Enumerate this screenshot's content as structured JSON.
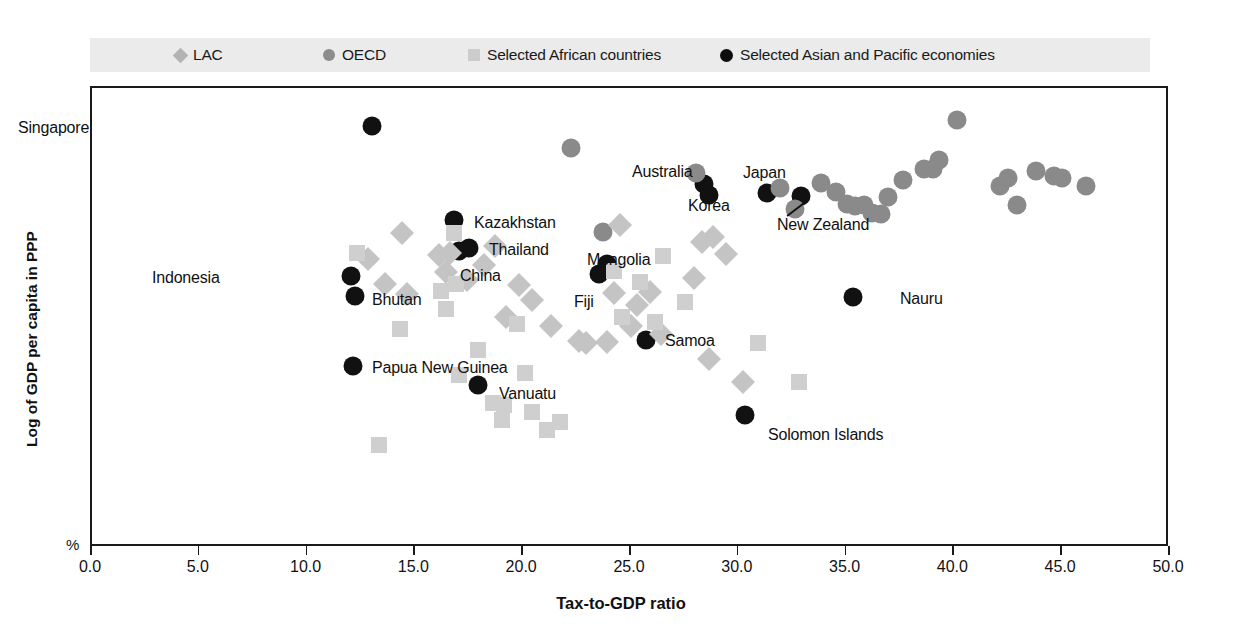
{
  "legend": {
    "items": [
      {
        "label": "LAC",
        "marker": "diamond",
        "color": "#b3b3b3",
        "x": 175
      },
      {
        "label": "OECD",
        "marker": "circle",
        "color": "#8c8c8c",
        "x": 323
      },
      {
        "label": "Selected African countries",
        "marker": "square",
        "color": "#cccccc",
        "x": 468
      },
      {
        "label": "Selected Asian and Pacific economies",
        "marker": "circle",
        "color": "#0d0d0d",
        "x": 720
      }
    ]
  },
  "axes": {
    "x_title": "Tax-to-GDP ratio",
    "y_title": "Log of GDP per capita in PPP",
    "y_unit": "%",
    "x_ticks": [
      "0.0",
      "5.0",
      "10.0",
      "15.0",
      "20.0",
      "25.0",
      "30.0",
      "35.0",
      "40.0",
      "45.0",
      "50.0"
    ]
  },
  "chart_data": {
    "type": "scatter",
    "title": "",
    "xlabel": "Tax-to-GDP ratio",
    "ylabel": "Log of GDP per capita in PPP",
    "xlim": [
      0.0,
      50.0
    ],
    "ylim": [
      0,
      100
    ],
    "grid": false,
    "legend_position": "top",
    "series": [
      {
        "name": "Selected Asian and Pacific economies",
        "marker": "circle",
        "color": "#111111",
        "points": [
          {
            "label": "Singapore",
            "x": 13.0,
            "y": 91.7,
            "lx": 16,
            "ly": 118
          },
          {
            "label": "Kazakhstan",
            "x": 16.8,
            "y": 71.3,
            "lx": 472,
            "ly": 213
          },
          {
            "label": "Thailand",
            "x": 17.5,
            "y": 65.2,
            "lx": 487,
            "ly": 240
          },
          {
            "label": "China",
            "x": 17.0,
            "y": 64.6,
            "lx": 458,
            "ly": 266
          },
          {
            "label": "Indonesia",
            "x": 12.0,
            "y": 59.1,
            "lx": 150,
            "ly": 268
          },
          {
            "label": "Bhutan",
            "x": 12.2,
            "y": 54.8,
            "lx": 370,
            "ly": 290
          },
          {
            "label": "Papua New Guinea",
            "x": 12.1,
            "y": 39.6,
            "lx": 370,
            "ly": 358
          },
          {
            "label": "Vanuatu",
            "x": 17.9,
            "y": 35.4,
            "lx": 497,
            "ly": 384
          },
          {
            "label": "Mongolia",
            "x": 23.9,
            "y": 61.7,
            "lx": 585,
            "ly": 250
          },
          {
            "label": "Fiji",
            "x": 23.5,
            "y": 59.6,
            "lx": 572,
            "ly": 292
          },
          {
            "label": "Samoa",
            "x": 25.7,
            "y": 45.2,
            "lx": 663,
            "ly": 331
          },
          {
            "label": "Solomon Islands",
            "x": 30.3,
            "y": 28.9,
            "lx": 766,
            "ly": 425
          },
          {
            "label": "Nauru",
            "x": 35.3,
            "y": 54.6,
            "lx": 898,
            "ly": 289
          },
          {
            "label": "Australia",
            "x": 28.4,
            "y": 79.1,
            "lx": 630,
            "ly": 162
          },
          {
            "label": "Korea",
            "x": 28.6,
            "y": 76.7,
            "lx": 686,
            "ly": 196
          },
          {
            "label": "Japan",
            "x": 31.3,
            "y": 77.1,
            "lx": 741,
            "ly": 163
          },
          {
            "label": "New Zealand",
            "x": 32.9,
            "y": 76.5,
            "lx": 775,
            "ly": 215
          }
        ]
      },
      {
        "name": "OECD",
        "marker": "circle",
        "color": "#8a8a8a",
        "points": [
          {
            "x": 22.2,
            "y": 87.0
          },
          {
            "x": 23.7,
            "y": 68.7
          },
          {
            "x": 28.0,
            "y": 81.6
          },
          {
            "x": 31.9,
            "y": 78.3
          },
          {
            "x": 32.6,
            "y": 73.7
          },
          {
            "x": 33.8,
            "y": 79.3
          },
          {
            "x": 34.5,
            "y": 77.4
          },
          {
            "x": 35.0,
            "y": 74.7
          },
          {
            "x": 35.4,
            "y": 74.3
          },
          {
            "x": 35.8,
            "y": 74.5
          },
          {
            "x": 36.2,
            "y": 72.9
          },
          {
            "x": 36.6,
            "y": 72.6
          },
          {
            "x": 36.9,
            "y": 76.4
          },
          {
            "x": 37.6,
            "y": 80.0
          },
          {
            "x": 38.6,
            "y": 82.3
          },
          {
            "x": 39.0,
            "y": 82.5
          },
          {
            "x": 39.3,
            "y": 84.3
          },
          {
            "x": 40.1,
            "y": 93.0
          },
          {
            "x": 42.1,
            "y": 78.8
          },
          {
            "x": 42.5,
            "y": 80.4
          },
          {
            "x": 42.9,
            "y": 74.5
          },
          {
            "x": 43.8,
            "y": 81.9
          },
          {
            "x": 44.6,
            "y": 80.9
          },
          {
            "x": 45.0,
            "y": 80.4
          },
          {
            "x": 46.1,
            "y": 78.6
          }
        ]
      },
      {
        "name": "LAC",
        "marker": "diamond",
        "color": "#c4c4c4",
        "points": [
          {
            "x": 12.8,
            "y": 62.9
          },
          {
            "x": 13.6,
            "y": 57.5
          },
          {
            "x": 14.4,
            "y": 68.5
          },
          {
            "x": 14.6,
            "y": 55.2
          },
          {
            "x": 16.1,
            "y": 63.8
          },
          {
            "x": 16.6,
            "y": 64.2
          },
          {
            "x": 16.4,
            "y": 60.0
          },
          {
            "x": 18.2,
            "y": 61.5
          },
          {
            "x": 17.4,
            "y": 58.3
          },
          {
            "x": 18.7,
            "y": 65.6
          },
          {
            "x": 19.8,
            "y": 57.2
          },
          {
            "x": 19.2,
            "y": 50.2
          },
          {
            "x": 20.4,
            "y": 53.9
          },
          {
            "x": 21.3,
            "y": 48.3
          },
          {
            "x": 22.6,
            "y": 45.0
          },
          {
            "x": 22.9,
            "y": 44.5
          },
          {
            "x": 23.9,
            "y": 44.7
          },
          {
            "x": 24.2,
            "y": 55.5
          },
          {
            "x": 24.5,
            "y": 70.2
          },
          {
            "x": 25.0,
            "y": 48.2
          },
          {
            "x": 25.3,
            "y": 52.8
          },
          {
            "x": 25.9,
            "y": 55.6
          },
          {
            "x": 26.4,
            "y": 46.5
          },
          {
            "x": 28.3,
            "y": 66.6
          },
          {
            "x": 28.8,
            "y": 67.6
          },
          {
            "x": 29.4,
            "y": 64.0
          },
          {
            "x": 27.9,
            "y": 58.8
          },
          {
            "x": 28.6,
            "y": 41.0
          },
          {
            "x": 30.2,
            "y": 36.0
          }
        ]
      },
      {
        "name": "Selected African countries",
        "marker": "square",
        "color": "#cfcfcf",
        "points": [
          {
            "x": 13.3,
            "y": 22.4
          },
          {
            "x": 12.3,
            "y": 64.2
          },
          {
            "x": 14.3,
            "y": 47.7
          },
          {
            "x": 16.2,
            "y": 55.8
          },
          {
            "x": 16.4,
            "y": 52.0
          },
          {
            "x": 16.8,
            "y": 68.4
          },
          {
            "x": 16.9,
            "y": 57.5
          },
          {
            "x": 17.0,
            "y": 37.7
          },
          {
            "x": 17.9,
            "y": 43.0
          },
          {
            "x": 18.6,
            "y": 31.5
          },
          {
            "x": 19.1,
            "y": 31.0
          },
          {
            "x": 19.0,
            "y": 27.9
          },
          {
            "x": 19.7,
            "y": 48.8
          },
          {
            "x": 20.1,
            "y": 38.1
          },
          {
            "x": 20.4,
            "y": 29.5
          },
          {
            "x": 21.1,
            "y": 25.6
          },
          {
            "x": 21.7,
            "y": 27.4
          },
          {
            "x": 24.2,
            "y": 60.3
          },
          {
            "x": 24.6,
            "y": 50.2
          },
          {
            "x": 25.4,
            "y": 57.8
          },
          {
            "x": 26.1,
            "y": 49.2
          },
          {
            "x": 26.5,
            "y": 63.5
          },
          {
            "x": 27.5,
            "y": 53.4
          },
          {
            "x": 30.9,
            "y": 44.6
          },
          {
            "x": 32.8,
            "y": 36.1
          }
        ]
      }
    ]
  }
}
